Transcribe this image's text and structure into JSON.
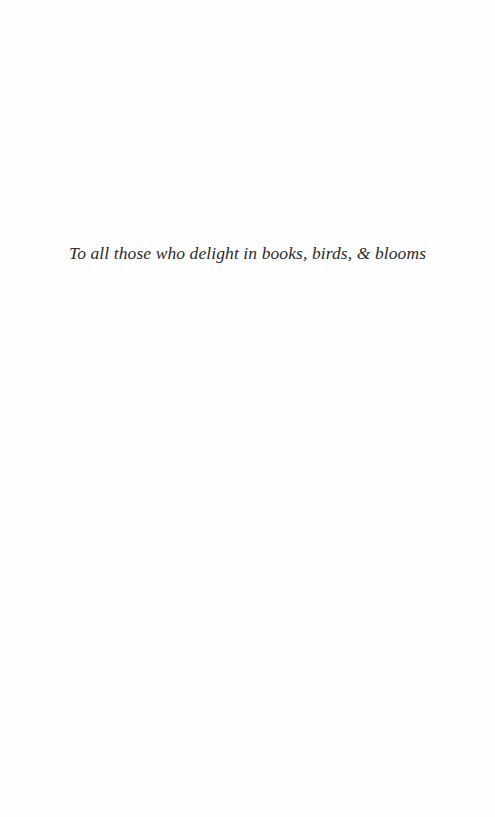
{
  "page": {
    "dedication": "To all those who delight in books, birds, & blooms"
  }
}
